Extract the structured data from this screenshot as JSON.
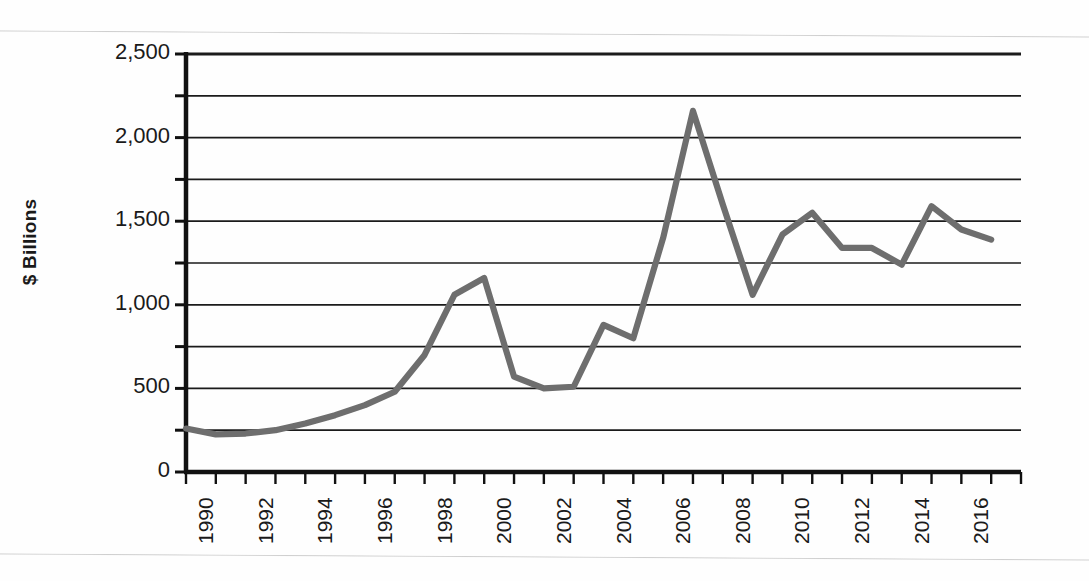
{
  "figure": {
    "ylabel": "$ Billions",
    "background": "#fefefe",
    "line_color": "#6e6e6e",
    "axis_color": "#111111",
    "grid_color": "#1b1b1b"
  },
  "chart_data": {
    "type": "line",
    "title": "",
    "xlabel": "",
    "ylabel": "$ Billions",
    "ylim": [
      0,
      2500
    ],
    "ytick_labels": [
      "0",
      "500",
      "1,000",
      "1,500",
      "2,000",
      "2,500"
    ],
    "ytick_values": [
      0,
      500,
      1000,
      1500,
      2000,
      2500
    ],
    "minor_gridlines": [
      250,
      750,
      1250,
      1750,
      2250
    ],
    "grid": "horizontal",
    "legend": "none",
    "xtick_labels": [
      "1990",
      "1992",
      "1994",
      "1996",
      "1998",
      "2000",
      "2002",
      "2004",
      "2006",
      "2008",
      "2010",
      "2012",
      "2014",
      "2016"
    ],
    "xlim": [
      1990,
      2017
    ],
    "x": [
      1990,
      1991,
      1992,
      1993,
      1994,
      1995,
      1996,
      1997,
      1998,
      1999,
      2000,
      2001,
      2002,
      2003,
      2004,
      2005,
      2006,
      2007,
      2008,
      2009,
      2010,
      2011,
      2012,
      2013,
      2014,
      2015,
      2016,
      2017
    ],
    "values": [
      260,
      225,
      230,
      250,
      290,
      340,
      400,
      480,
      700,
      1060,
      1160,
      570,
      500,
      510,
      880,
      800,
      1400,
      2160,
      1600,
      1060,
      1420,
      1550,
      1340,
      1340,
      1240,
      1590,
      1450,
      1390
    ],
    "series": [
      {
        "name": "Value",
        "color": "#6e6e6e",
        "values": [
          260,
          225,
          230,
          250,
          290,
          340,
          400,
          480,
          700,
          1060,
          1160,
          570,
          500,
          510,
          880,
          800,
          1400,
          2160,
          1600,
          1060,
          1420,
          1550,
          1340,
          1340,
          1240,
          1590,
          1450,
          1390
        ]
      }
    ]
  }
}
